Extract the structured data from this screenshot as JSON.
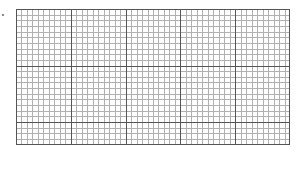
{
  "chart_data": {
    "type": "line",
    "title": "",
    "xlabel": "",
    "ylabel": "",
    "categories": [],
    "series": [],
    "grid": true,
    "legend": null,
    "grid_layout": {
      "major_columns": 5,
      "major_rows_full": 2,
      "minor_per_major": 10,
      "extra_minor_rows_bottom": 4
    }
  },
  "colors": {
    "background": "#ffffff",
    "major_line": "#555555",
    "minor_line": "#b0b0b0",
    "border": "#555555",
    "marker": "#8a8a8a"
  }
}
